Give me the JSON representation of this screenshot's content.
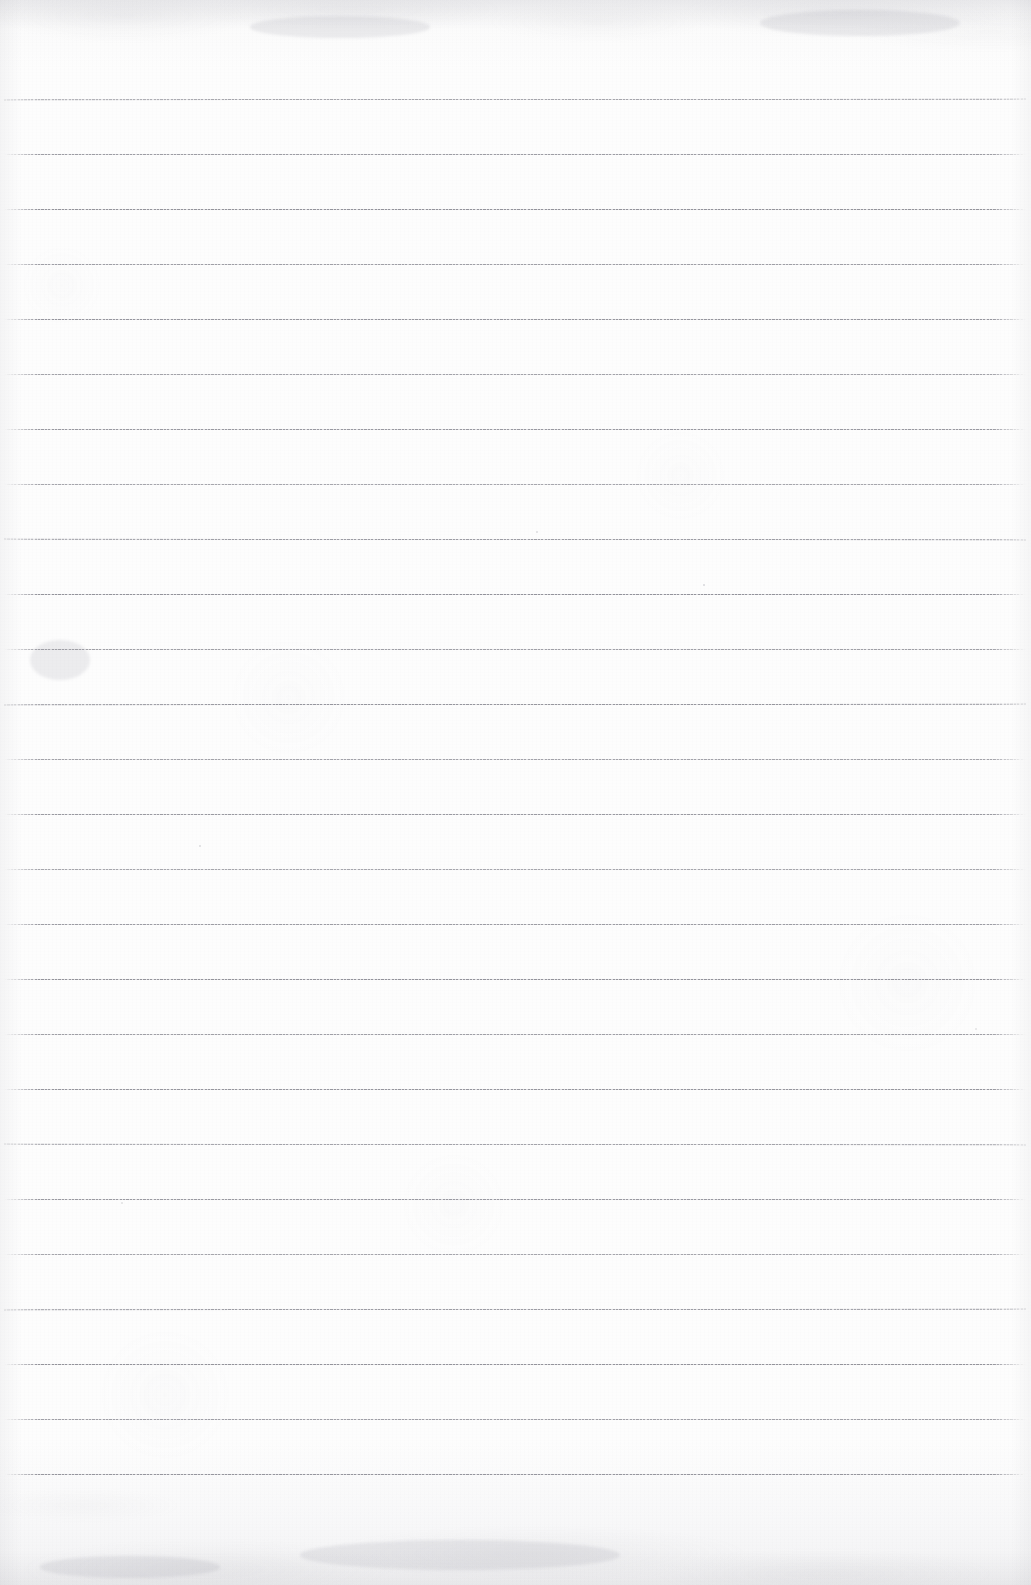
{
  "document": {
    "kind": "lined-notebook-paper-scan",
    "title": "Blank ruled paper",
    "width": 1031,
    "height": 1585,
    "written_content": "",
    "background_color": "#fdfdfd",
    "edge_tint_color": "#f2f2f3",
    "rule_color": "#7a7a84",
    "rule_count": 26,
    "rule_first_y": 99,
    "rule_spacing": 55,
    "rule_left_x": 4,
    "rule_right_x": 1026,
    "rule_thickness": 1,
    "rules_y": [
      99,
      154,
      209,
      264,
      319,
      374,
      429,
      484,
      539,
      594,
      649,
      704,
      759,
      814,
      869,
      924,
      979,
      1034,
      1089,
      1144,
      1199,
      1254,
      1309,
      1364,
      1419,
      1474
    ],
    "top_margin_px": 99,
    "bottom_margin_px": 111,
    "marks": [
      {
        "name": "speck-upper-right",
        "x": 703,
        "y": 584,
        "size": 2.4,
        "opacity": 0.5
      },
      {
        "name": "speck-left-mid",
        "x": 199,
        "y": 845,
        "size": 2.0,
        "opacity": 0.45
      },
      {
        "name": "speck-center",
        "x": 536,
        "y": 531,
        "size": 1.8,
        "opacity": 0.4
      },
      {
        "name": "speck-lower-left",
        "x": 121,
        "y": 1202,
        "size": 1.6,
        "opacity": 0.35
      },
      {
        "name": "speck-right-edge",
        "x": 975,
        "y": 1028,
        "size": 1.5,
        "opacity": 0.3
      }
    ],
    "smudges": [
      {
        "name": "smudge-top-band",
        "x": 250,
        "y": 16,
        "w": 180,
        "h": 22
      },
      {
        "name": "smudge-top-right",
        "x": 760,
        "y": 10,
        "w": 200,
        "h": 26
      },
      {
        "name": "smudge-bottom-band",
        "x": 300,
        "y": 1540,
        "w": 320,
        "h": 30
      },
      {
        "name": "smudge-bottom-left",
        "x": 40,
        "y": 1556,
        "w": 180,
        "h": 22
      },
      {
        "name": "smudge-mid-left",
        "x": 30,
        "y": 640,
        "w": 60,
        "h": 40
      }
    ]
  }
}
